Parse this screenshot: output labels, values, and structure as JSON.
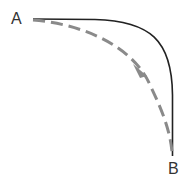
{
  "labels": {
    "start": "A",
    "end": "B"
  },
  "colors": {
    "solid_path": "#222222",
    "dashed_path": "#8a8a8a",
    "text": "#333333"
  },
  "paths": [
    {
      "name": "solid-curve",
      "style": "solid",
      "from": "A",
      "to": "B"
    },
    {
      "name": "dashed-arrow-curve",
      "style": "dashed",
      "from": "A",
      "to": "B",
      "arrow": true
    }
  ]
}
